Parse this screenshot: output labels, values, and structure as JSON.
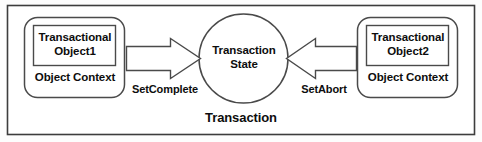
{
  "diagram": {
    "container": {
      "label": "Transaction",
      "border_color": "#3d3d3d",
      "fill_color": "#ffffff"
    },
    "nodes": [
      {
        "id": "transactional-object-1",
        "title": "Transactional\nObject1",
        "context_label": "Object Context",
        "shape": "rounded-rectangle",
        "border_color": "#4a4a4a"
      },
      {
        "id": "transaction-state",
        "label": "Transaction\nState",
        "shape": "circle",
        "border_color": "#4a4a4a"
      },
      {
        "id": "transactional-object-2",
        "title": "Transactional\nObject2",
        "context_label": "Object Context",
        "shape": "rounded-rectangle",
        "border_color": "#4a4a4a"
      }
    ],
    "arrows": [
      {
        "id": "set-complete-arrow",
        "label": "SetComplete",
        "direction": "right",
        "from": "transactional-object-1",
        "to": "transaction-state"
      },
      {
        "id": "set-abort-arrow",
        "label": "SetAbort",
        "direction": "left",
        "from": "transactional-object-2",
        "to": "transaction-state"
      }
    ]
  }
}
